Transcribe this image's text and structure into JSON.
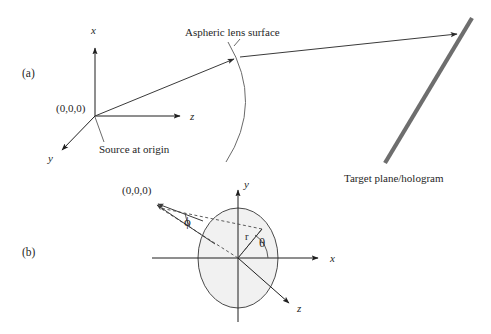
{
  "figure": {
    "background_color": "#ffffff",
    "ink_color": "#1f1f1f",
    "plane_color": "#6e6e6e",
    "ellipse_fill_color": "#ececec"
  },
  "panel_a": {
    "label": "(a)",
    "origin_label": "(0,0,0)",
    "axis_x_label": "x",
    "axis_y_label": "y",
    "axis_z_label": "z",
    "source_annotation": "Source at origin",
    "lens_annotation": "Aspheric lens surface",
    "target_annotation": "Target plane/hologram"
  },
  "panel_b": {
    "label": "(b)",
    "origin_label": "(0,0,0)",
    "axis_x_label": "x",
    "axis_y_label": "y",
    "axis_z_label": "z",
    "angle_phi_label": "ϕ",
    "angle_theta_label": "θ",
    "radius_label": "r"
  }
}
